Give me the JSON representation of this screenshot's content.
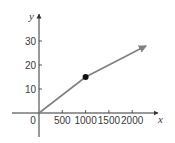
{
  "chart_data": {
    "type": "line",
    "title": "",
    "xlabel": "x",
    "ylabel": "y",
    "xlim": [
      -580,
      2560
    ],
    "ylim": [
      -10,
      41
    ],
    "grid": false,
    "legend": null,
    "x_ticks": [
      0,
      500,
      1000,
      1500,
      2000
    ],
    "x_tick_labels": [
      "0",
      "500",
      "1000",
      "1500",
      "2000"
    ],
    "y_ticks": [
      10,
      20,
      30
    ],
    "y_tick_labels": [
      "10",
      "20",
      "30"
    ],
    "series": [
      {
        "name": "piecewise linear",
        "color": "#808080",
        "points": [
          [
            0,
            0
          ],
          [
            1000,
            15
          ],
          [
            2300,
            28
          ]
        ],
        "end_arrow": true
      }
    ],
    "annotations": [
      {
        "type": "point",
        "x": 1000,
        "y": 15,
        "color": "#111111",
        "filled": true
      }
    ]
  }
}
